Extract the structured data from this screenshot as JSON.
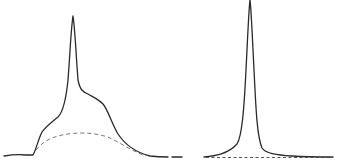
{
  "figure": {
    "panels": [
      {
        "id": "left",
        "description": "Broad asymmetric profile with a sharp central peak, shoulders on both sides, and a dashed broad background curve",
        "solid_curve_color": "#2a2a2a",
        "dashed_curve_color": "#777777"
      },
      {
        "id": "right",
        "description": "Single narrow Lorentzian-like peak with dashed flat baseline",
        "solid_curve_color": "#2a2a2a",
        "dashed_curve_color": "#444444"
      }
    ]
  }
}
